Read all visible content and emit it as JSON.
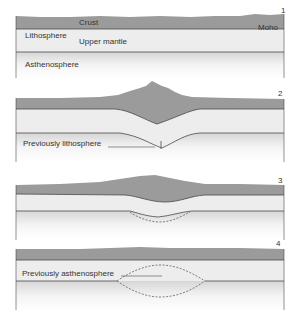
{
  "colors": {
    "crust": "#9b9b9b",
    "lithosphere": "#ededed",
    "asthenosphere_top": "#dcdcdc",
    "background": "#ffffff",
    "line": "#4a4a4a"
  },
  "panels": [
    {
      "number": "1",
      "labels": {
        "crust": "Crust",
        "moho": "Moho",
        "lithosphere": "Lithosphere",
        "upper_mantle": "Upper mantle",
        "asthenosphere": "Asthenosphere"
      }
    },
    {
      "number": "2",
      "labels": {
        "previously_lithosphere": "Previously lithosphere"
      }
    },
    {
      "number": "3",
      "labels": {}
    },
    {
      "number": "4",
      "labels": {
        "previously_asthenosphere": "Previously asthenosphere"
      }
    }
  ]
}
